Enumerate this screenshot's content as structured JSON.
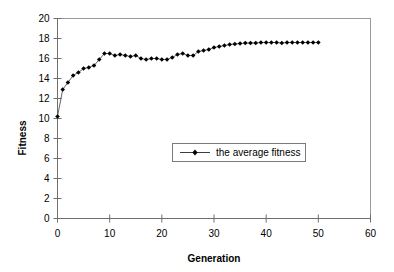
{
  "chart_data": {
    "type": "line",
    "title": "",
    "xlabel": "Generation",
    "ylabel": "Fitness",
    "xlim": [
      0,
      60
    ],
    "ylim": [
      0,
      20
    ],
    "xticks": [
      0,
      10,
      20,
      30,
      40,
      50,
      60
    ],
    "yticks": [
      0,
      2,
      4,
      6,
      8,
      10,
      12,
      14,
      16,
      18,
      20
    ],
    "xtick_labels": [
      "0",
      "10",
      "20",
      "30",
      "40",
      "50",
      "60"
    ],
    "ytick_labels": [
      "0",
      "2",
      "4",
      "6",
      "8",
      "10",
      "12",
      "14",
      "16",
      "18",
      "20"
    ],
    "grid": false,
    "legend_position": "center",
    "legend": [
      "the average fitness"
    ],
    "marker": "diamond",
    "series": [
      {
        "name": "the average fitness",
        "x": [
          0,
          1,
          2,
          3,
          4,
          5,
          6,
          7,
          8,
          9,
          10,
          11,
          12,
          13,
          14,
          15,
          16,
          17,
          18,
          19,
          20,
          21,
          22,
          23,
          24,
          25,
          26,
          27,
          28,
          29,
          30,
          31,
          32,
          33,
          34,
          35,
          36,
          37,
          38,
          39,
          40,
          41,
          42,
          43,
          44,
          45,
          46,
          47,
          48,
          49,
          50
        ],
        "values": [
          10.2,
          12.9,
          13.6,
          14.3,
          14.6,
          15.0,
          15.1,
          15.3,
          15.9,
          16.5,
          16.5,
          16.3,
          16.4,
          16.3,
          16.2,
          16.3,
          16.0,
          15.9,
          16.0,
          16.0,
          15.9,
          15.9,
          16.1,
          16.4,
          16.5,
          16.3,
          16.3,
          16.7,
          16.8,
          16.9,
          17.1,
          17.2,
          17.3,
          17.4,
          17.45,
          17.5,
          17.55,
          17.55,
          17.55,
          17.6,
          17.6,
          17.6,
          17.6,
          17.55,
          17.6,
          17.6,
          17.6,
          17.6,
          17.6,
          17.6,
          17.6
        ]
      }
    ]
  },
  "axis": {
    "y_title": "Fitness",
    "x_title": "Generation"
  },
  "legend_entry": {
    "label": "the average fitness"
  }
}
